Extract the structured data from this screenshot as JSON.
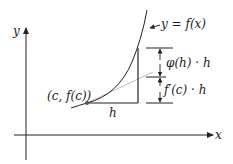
{
  "diagram": {
    "axes": {
      "x_label": "x",
      "y_label": "y"
    },
    "curve_label": "y = f(x)",
    "point_label": "(c, f(c))",
    "h_label": "h",
    "phi_label": "φ(h) · h",
    "fprime_label": "f′(c) · h",
    "colors": {
      "ink": "#222222",
      "tangent": "#bdbdbd",
      "point": "#555555",
      "background": "#ffffff"
    }
  }
}
